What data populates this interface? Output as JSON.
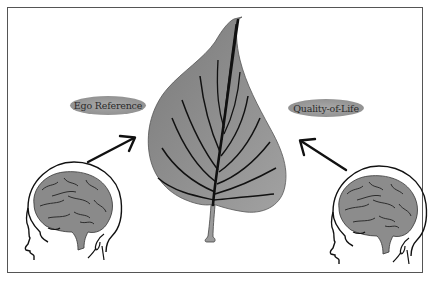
{
  "figure": {
    "labels": {
      "left": "Ego Reference",
      "right": "Quality-of-Life"
    },
    "elements": {
      "center": "leaf-icon",
      "left_source": "head-with-brain-icon",
      "right_source": "head-with-brain-icon",
      "left_arrow": "arrow-up-right-icon",
      "right_arrow": "arrow-up-left-icon"
    },
    "colors": {
      "leaf_fill": "#8c8c8c",
      "leaf_veins": "#1a1a1a",
      "brain_fill": "#8a8a8a",
      "label_fill": "#9e9e9e",
      "outline": "#111111",
      "frame": "#555555",
      "background": "#ffffff"
    }
  }
}
